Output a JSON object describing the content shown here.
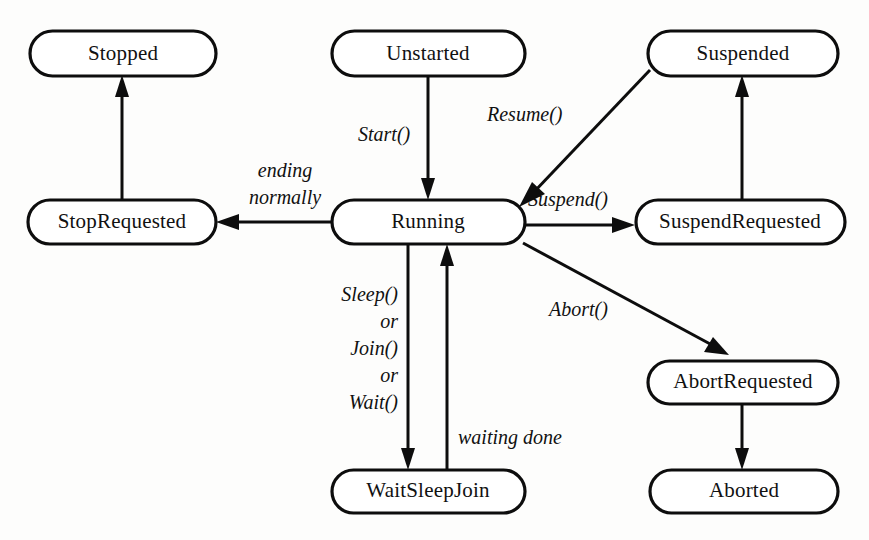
{
  "diagram": {
    "type": "state-machine",
    "colors": {
      "background": "#fdfdfc",
      "node_fill": "#ffffff",
      "stroke": "#0d0d0d",
      "text": "#111111"
    },
    "nodes": [
      {
        "id": "stopped",
        "label": "Stopped",
        "x": 30,
        "y": 31,
        "w": 186,
        "h": 45
      },
      {
        "id": "unstarted",
        "label": "Unstarted",
        "x": 332,
        "y": 31,
        "w": 193,
        "h": 45
      },
      {
        "id": "suspended",
        "label": "Suspended",
        "x": 648,
        "y": 31,
        "w": 190,
        "h": 45
      },
      {
        "id": "stoprequested",
        "label": "StopRequested",
        "x": 28,
        "y": 200,
        "w": 188,
        "h": 44
      },
      {
        "id": "running",
        "label": "Running",
        "x": 332,
        "y": 200,
        "w": 193,
        "h": 44
      },
      {
        "id": "suspendrequested",
        "label": "SuspendRequested",
        "x": 636,
        "y": 200,
        "w": 209,
        "h": 44
      },
      {
        "id": "abortrequested",
        "label": "AbortRequested",
        "x": 648,
        "y": 361,
        "w": 190,
        "h": 43
      },
      {
        "id": "waitsleepjoin",
        "label": "WaitSleepJoin",
        "x": 332,
        "y": 470,
        "w": 193,
        "h": 43
      },
      {
        "id": "aborted",
        "label": "Aborted",
        "x": 650,
        "y": 470,
        "w": 188,
        "h": 43
      }
    ],
    "edges": [
      {
        "id": "start",
        "from": "unstarted",
        "to": "running",
        "label": "Start()"
      },
      {
        "id": "ending-normally",
        "from": "running",
        "to": "stoprequested",
        "label": "ending\nnormally"
      },
      {
        "id": "stop",
        "from": "stoprequested",
        "to": "stopped",
        "label": ""
      },
      {
        "id": "suspend",
        "from": "running",
        "to": "suspendrequested",
        "label": "Suspend()"
      },
      {
        "id": "suspend-complete",
        "from": "suspendrequested",
        "to": "suspended",
        "label": ""
      },
      {
        "id": "resume",
        "from": "suspended",
        "to": "running",
        "label": "Resume()"
      },
      {
        "id": "abort",
        "from": "running",
        "to": "abortrequested",
        "label": "Abort()"
      },
      {
        "id": "abort-complete",
        "from": "abortrequested",
        "to": "aborted",
        "label": ""
      },
      {
        "id": "sleep-join-wait",
        "from": "running",
        "to": "waitsleepjoin",
        "label": "Sleep()\nor\nJoin()\nor\nWait()"
      },
      {
        "id": "waiting-done",
        "from": "waitsleepjoin",
        "to": "running",
        "label": "waiting done"
      }
    ],
    "labels": {
      "start": "Start()",
      "ending_1": "ending",
      "ending_2": "normally",
      "resume": "Resume()",
      "suspend": "Suspend()",
      "abort": "Abort()",
      "sleep_1": "Sleep()",
      "sleep_2": "or",
      "sleep_3": "Join()",
      "sleep_4": "or",
      "sleep_5": "Wait()",
      "waiting_done": "waiting done"
    },
    "node_labels": {
      "stopped": "Stopped",
      "unstarted": "Unstarted",
      "suspended": "Suspended",
      "stoprequested": "StopRequested",
      "running": "Running",
      "suspendrequested": "SuspendRequested",
      "abortrequested": "AbortRequested",
      "waitsleepjoin": "WaitSleepJoin",
      "aborted": "Aborted"
    }
  }
}
